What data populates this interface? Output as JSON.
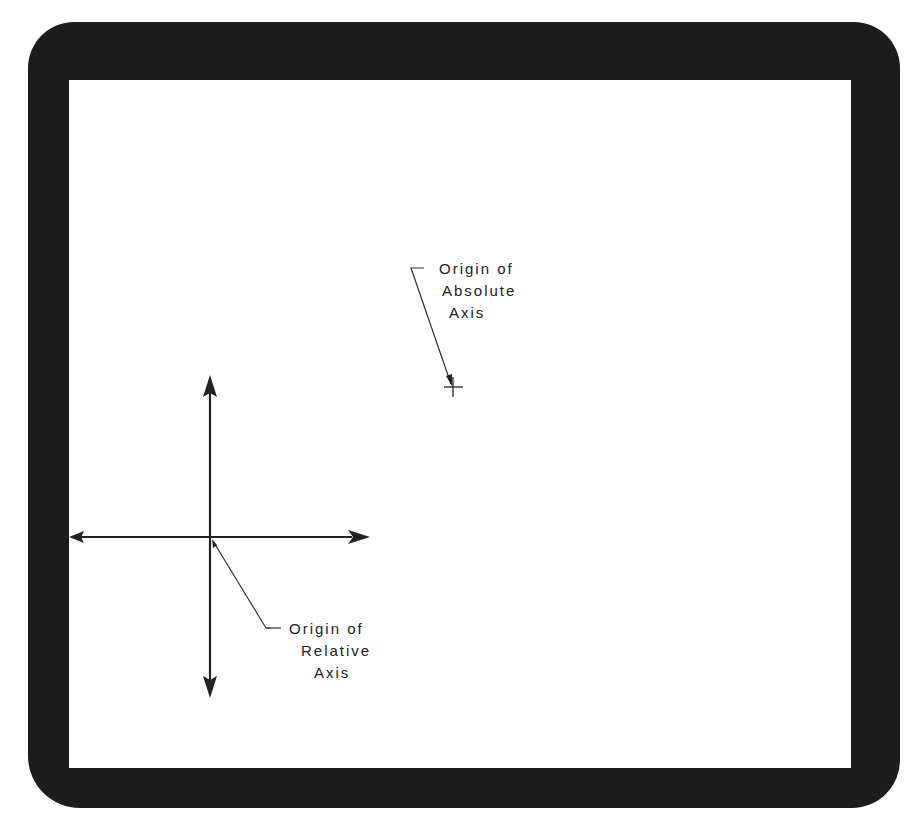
{
  "diagram": {
    "type": "coordinate-axes-on-display-screen",
    "colors": {
      "bezel": "#1c1c1c",
      "screen": "#ffffff",
      "ink": "#222222"
    },
    "absolute_origin": {
      "label_line1": "Origin of",
      "label_line2": "Absolute",
      "label_line3": "Axis",
      "marker": "crosshair",
      "position_px": [
        453,
        387
      ]
    },
    "relative_origin": {
      "label_line1": "Origin of",
      "label_line2": "Relative",
      "label_line3": "Axis",
      "position_px": [
        210,
        537
      ]
    },
    "axes": {
      "horizontal": {
        "from_px": [
          69,
          537
        ],
        "to_px": [
          370,
          537
        ],
        "arrows": "both"
      },
      "vertical": {
        "from_px": [
          210,
          375
        ],
        "to_px": [
          210,
          698
        ],
        "arrows": "both"
      }
    }
  }
}
